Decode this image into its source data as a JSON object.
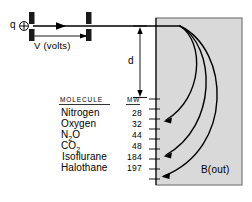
{
  "figure": {
    "source_label": "q",
    "charge_symbol": "⊕",
    "accelerator_label": "V (volts)",
    "drift_label": "d",
    "field_label": "B(out)",
    "field_fill": "#d9d9d9",
    "line_color": "#000000",
    "background": "#ffffff"
  },
  "table": {
    "headers": {
      "molecule": "MOLECULE",
      "mw": "MW"
    },
    "rows": [
      {
        "molecule": "Nitrogen",
        "mw": "28"
      },
      {
        "molecule": "Oxygen",
        "mw": "32"
      },
      {
        "molecule": "N",
        "molecule_sub": "2",
        "molecule_tail": "O",
        "mw": "44"
      },
      {
        "molecule": "CO",
        "molecule_sub": "2",
        "molecule_tail": "",
        "mw": "48"
      },
      {
        "molecule": "Isoflurane",
        "mw": "184"
      },
      {
        "molecule": "Halothane",
        "mw": "197"
      }
    ]
  },
  "trajectories": [
    {
      "name": "light-ion-arc",
      "lands_at_mw": "32"
    },
    {
      "name": "medium-ion-arc",
      "lands_at_mw": "184"
    },
    {
      "name": "heavy-ion-arc",
      "lands_at_mw": "197"
    }
  ]
}
